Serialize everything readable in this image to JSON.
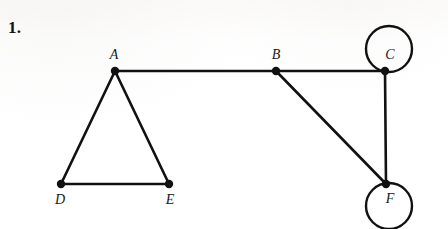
{
  "figure": {
    "item_number": "1.",
    "type": "undirected-graph-diagram",
    "stroke_color": "#111111",
    "vertex_color": "#111111",
    "background_color": "#ffffff",
    "edge_width": 2.6,
    "loop_width": 2.4,
    "vertex_radius": 4.2
  },
  "vertices": [
    {
      "id": "A",
      "label": "A",
      "x": 115,
      "y": 71,
      "label_x": 114,
      "label_y": 55
    },
    {
      "id": "B",
      "label": "B",
      "x": 276,
      "y": 71,
      "label_x": 276,
      "label_y": 55
    },
    {
      "id": "C",
      "label": "C",
      "x": 385,
      "y": 71,
      "label_x": 390,
      "label_y": 55
    },
    {
      "id": "D",
      "label": "D",
      "x": 61,
      "y": 184,
      "label_x": 60,
      "label_y": 200
    },
    {
      "id": "E",
      "label": "E",
      "x": 169,
      "y": 184,
      "label_x": 170,
      "label_y": 200
    },
    {
      "id": "F",
      "label": "F",
      "x": 386,
      "y": 184,
      "label_x": 390,
      "label_y": 199
    }
  ],
  "edges": [
    {
      "from": "A",
      "to": "B"
    },
    {
      "from": "A",
      "to": "D"
    },
    {
      "from": "A",
      "to": "E"
    },
    {
      "from": "D",
      "to": "E"
    },
    {
      "from": "B",
      "to": "C"
    },
    {
      "from": "B",
      "to": "F"
    },
    {
      "from": "C",
      "to": "F"
    }
  ],
  "self_loops": [
    {
      "at": "C",
      "center_x": 389,
      "center_y": 49,
      "radius": 23
    },
    {
      "at": "F",
      "center_x": 389,
      "center_y": 206,
      "radius": 23
    }
  ]
}
